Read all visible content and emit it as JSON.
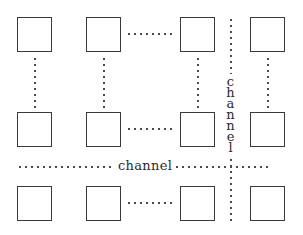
{
  "diagram": {
    "canvas": {
      "width": 303,
      "height": 235,
      "background": "#ffffff"
    },
    "colors": {
      "box_border": "#3a3a3a",
      "dot": "#4a4a4a",
      "text": "#2b2b2b",
      "background": "#ffffff"
    },
    "labels": {
      "channel_horizontal": "channel",
      "channel_vertical_letters": [
        "c",
        "h",
        "a",
        "n",
        "n",
        "e",
        "l"
      ],
      "channel_vertical_text": "channel"
    },
    "grid": {
      "rows": 3,
      "columns": 4,
      "box_size": 35,
      "column_x": [
        17,
        86,
        180,
        250
      ],
      "row_y": [
        17,
        112,
        186
      ],
      "ellipsis_between_columns": [
        2,
        3
      ],
      "ellipsis_between_rows": [
        1,
        2
      ]
    },
    "boxes": [
      {
        "id": "pe-r1c1",
        "row": 1,
        "col": 1,
        "x": 17,
        "y": 17
      },
      {
        "id": "pe-r1c2",
        "row": 1,
        "col": 2,
        "x": 86,
        "y": 17
      },
      {
        "id": "pe-r1c3",
        "row": 1,
        "col": 3,
        "x": 180,
        "y": 17
      },
      {
        "id": "pe-r1c4",
        "row": 1,
        "col": 4,
        "x": 250,
        "y": 17
      },
      {
        "id": "pe-r2c1",
        "row": 2,
        "col": 1,
        "x": 17,
        "y": 112
      },
      {
        "id": "pe-r2c2",
        "row": 2,
        "col": 2,
        "x": 86,
        "y": 112
      },
      {
        "id": "pe-r2c3",
        "row": 2,
        "col": 3,
        "x": 180,
        "y": 112
      },
      {
        "id": "pe-r2c4",
        "row": 2,
        "col": 4,
        "x": 250,
        "y": 112
      },
      {
        "id": "pe-r3c1",
        "row": 3,
        "col": 1,
        "x": 17,
        "y": 186
      },
      {
        "id": "pe-r3c2",
        "row": 3,
        "col": 2,
        "x": 86,
        "y": 186
      },
      {
        "id": "pe-r3c3",
        "row": 3,
        "col": 3,
        "x": 180,
        "y": 186
      },
      {
        "id": "pe-r3c4",
        "row": 3,
        "col": 4,
        "x": 250,
        "y": 186
      }
    ],
    "connectors_horizontal": [
      {
        "id": "hdots-r1",
        "x": 126,
        "y": 34,
        "width": 50
      },
      {
        "id": "hdots-r2",
        "x": 126,
        "y": 129,
        "width": 50
      },
      {
        "id": "hdots-r3",
        "x": 126,
        "y": 203,
        "width": 50
      }
    ],
    "connectors_vertical": [
      {
        "id": "vdots-c1",
        "x": 34,
        "y": 56,
        "height": 52
      },
      {
        "id": "vdots-c2",
        "x": 103,
        "y": 56,
        "height": 52
      },
      {
        "id": "vdots-c3",
        "x": 197,
        "y": 56,
        "height": 52
      },
      {
        "id": "vdots-c4",
        "x": 267,
        "y": 56,
        "height": 52
      }
    ],
    "channel_horizontal": {
      "id": "channel-line-h",
      "y": 166,
      "segment_left": {
        "x": 17,
        "width": 99
      },
      "segment_right": {
        "x": 162,
        "width": 110
      },
      "label_x": 117,
      "label_y": 159
    },
    "channel_vertical": {
      "id": "channel-line-v",
      "x": 230,
      "segment_top": {
        "y": 17,
        "height": 58
      },
      "segment_bottom": {
        "y": 157,
        "height": 65
      },
      "label_x": 224,
      "label_y": 74
    }
  }
}
